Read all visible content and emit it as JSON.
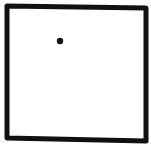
{
  "canvas": {
    "width": 151,
    "height": 146,
    "background": "#ffffff"
  },
  "shapes": {
    "square": {
      "stroke": "#111111",
      "stroke_width": 5,
      "points": "7,6 146,8 146,141 7,138"
    },
    "dot": {
      "cx": 60,
      "cy": 41,
      "r": 3.2,
      "fill": "#111111"
    }
  }
}
